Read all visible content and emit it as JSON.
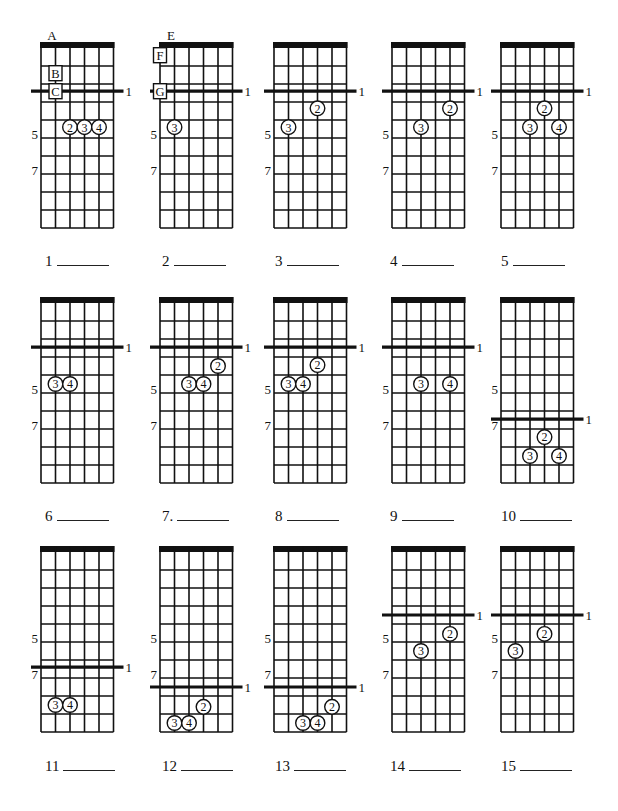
{
  "worksheet": {
    "grid": {
      "strings": 6,
      "frets": 10,
      "string_spacing": 14.5,
      "fret_spacing": 18,
      "nut_thickness": 6,
      "line_color": "#111111",
      "fret_labels": [
        "5",
        "7"
      ],
      "fret_label_positions": [
        5,
        7
      ]
    },
    "rows_top": [
      42,
      297,
      546
    ],
    "cols_left": [
      41,
      160,
      274,
      392,
      501
    ],
    "diagrams": [
      {
        "number": "1",
        "label": "1",
        "row": 0,
        "col": 0,
        "bar": 2.4,
        "bar_label": "1",
        "top_letter": "A",
        "boxes": [
          {
            "text": "B",
            "string": 1,
            "pos": 1.4
          },
          {
            "text": "C",
            "string": 1,
            "pos": 2.4
          }
        ],
        "fingers": [
          {
            "finger": "2",
            "string": 2,
            "pos": 4.4
          },
          {
            "finger": "3",
            "string": 3,
            "pos": 4.4
          },
          {
            "finger": "4",
            "string": 4,
            "pos": 4.4
          }
        ]
      },
      {
        "number": "2",
        "label": "2",
        "row": 0,
        "col": 1,
        "bar": 2.4,
        "bar_label": "1",
        "top_letter": "E",
        "boxes": [
          {
            "text": "F",
            "string": 0,
            "pos": 0.4
          },
          {
            "text": "G",
            "string": 0,
            "pos": 2.4
          }
        ],
        "fingers": [
          {
            "finger": "3",
            "string": 1,
            "pos": 4.4
          }
        ]
      },
      {
        "number": "3",
        "label": "3",
        "row": 0,
        "col": 2,
        "bar": 2.4,
        "bar_label": "1",
        "fingers": [
          {
            "finger": "2",
            "string": 3,
            "pos": 3.35
          },
          {
            "finger": "3",
            "string": 1,
            "pos": 4.4
          }
        ]
      },
      {
        "number": "4",
        "label": "4",
        "row": 0,
        "col": 3,
        "bar": 2.4,
        "bar_label": "1",
        "fingers": [
          {
            "finger": "2",
            "string": 4,
            "pos": 3.35
          },
          {
            "finger": "3",
            "string": 2,
            "pos": 4.4
          }
        ]
      },
      {
        "number": "5",
        "label": "5",
        "row": 0,
        "col": 4,
        "bar": 2.4,
        "bar_label": "1",
        "fingers": [
          {
            "finger": "2",
            "string": 3,
            "pos": 3.35
          },
          {
            "finger": "3",
            "string": 2,
            "pos": 4.4
          },
          {
            "finger": "4",
            "string": 4,
            "pos": 4.4
          }
        ]
      },
      {
        "number": "6",
        "label": "6",
        "row": 1,
        "col": 0,
        "bar": 2.45,
        "bar_label": "1",
        "fingers": [
          {
            "finger": "3",
            "string": 1,
            "pos": 4.5
          },
          {
            "finger": "4",
            "string": 2,
            "pos": 4.5
          }
        ]
      },
      {
        "number": "7",
        "label": "7.",
        "row": 1,
        "col": 1,
        "bar": 2.45,
        "bar_label": "1",
        "fingers": [
          {
            "finger": "2",
            "string": 4,
            "pos": 3.5
          },
          {
            "finger": "3",
            "string": 2,
            "pos": 4.5
          },
          {
            "finger": "4",
            "string": 3,
            "pos": 4.5
          }
        ]
      },
      {
        "number": "8",
        "label": "8",
        "row": 1,
        "col": 2,
        "bar": 2.45,
        "bar_label": "1",
        "fingers": [
          {
            "finger": "2",
            "string": 3,
            "pos": 3.45
          },
          {
            "finger": "3",
            "string": 1,
            "pos": 4.5
          },
          {
            "finger": "4",
            "string": 2,
            "pos": 4.5
          }
        ]
      },
      {
        "number": "9",
        "label": "9",
        "row": 1,
        "col": 3,
        "bar": 2.45,
        "bar_label": "1",
        "fingers": [
          {
            "finger": "3",
            "string": 2,
            "pos": 4.5
          },
          {
            "finger": "4",
            "string": 4,
            "pos": 4.5
          }
        ]
      },
      {
        "number": "10",
        "label": "10",
        "row": 1,
        "col": 4,
        "bar": 6.45,
        "bar_label": "1",
        "fingers": [
          {
            "finger": "2",
            "string": 3,
            "pos": 7.45
          },
          {
            "finger": "3",
            "string": 2,
            "pos": 8.5
          },
          {
            "finger": "4",
            "string": 4,
            "pos": 8.5
          }
        ]
      },
      {
        "number": "11",
        "label": "11",
        "row": 2,
        "col": 0,
        "bar": 6.4,
        "bar_label": "1",
        "fingers": [
          {
            "finger": "3",
            "string": 1,
            "pos": 8.5
          },
          {
            "finger": "4",
            "string": 2,
            "pos": 8.5
          }
        ]
      },
      {
        "number": "12",
        "label": "12",
        "row": 2,
        "col": 1,
        "bar": 7.5,
        "bar_label": "1",
        "fingers": [
          {
            "finger": "2",
            "string": 3,
            "pos": 8.6
          },
          {
            "finger": "3",
            "string": 1,
            "pos": 9.5
          },
          {
            "finger": "4",
            "string": 2,
            "pos": 9.5
          }
        ]
      },
      {
        "number": "13",
        "label": "13",
        "row": 2,
        "col": 2,
        "bar": 7.5,
        "bar_label": "1",
        "fingers": [
          {
            "finger": "2",
            "string": 4,
            "pos": 8.6
          },
          {
            "finger": "3",
            "string": 2,
            "pos": 9.5
          },
          {
            "finger": "4",
            "string": 3,
            "pos": 9.5
          }
        ]
      },
      {
        "number": "14",
        "label": "14",
        "row": 2,
        "col": 3,
        "bar": 3.5,
        "bar_label": "1",
        "fingers": [
          {
            "finger": "2",
            "string": 4,
            "pos": 4.55
          },
          {
            "finger": "3",
            "string": 2,
            "pos": 5.5
          }
        ]
      },
      {
        "number": "15",
        "label": "15",
        "row": 2,
        "col": 4,
        "bar": 3.5,
        "bar_label": "1",
        "fingers": [
          {
            "finger": "2",
            "string": 3,
            "pos": 4.55
          },
          {
            "finger": "3",
            "string": 1,
            "pos": 5.5
          }
        ]
      }
    ],
    "answer_rows_y": [
      267,
      522,
      772
    ],
    "answer_cols_x": [
      45,
      162,
      275,
      390,
      501
    ]
  }
}
